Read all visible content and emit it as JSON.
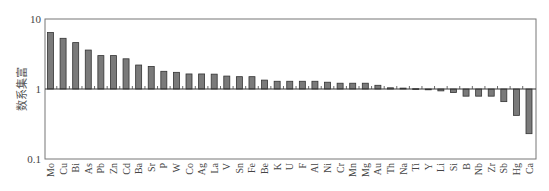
{
  "chart_data": {
    "type": "bar",
    "title": "",
    "xlabel": "",
    "ylabel": "富集系数",
    "yscale": "log",
    "ylim": [
      0.1,
      10
    ],
    "yticks": [
      {
        "value": 10,
        "label": "10"
      },
      {
        "value": 1,
        "label": "1"
      },
      {
        "value": 0.1,
        "label": "0.1"
      }
    ],
    "baseline": 1,
    "grid": false,
    "legend": null,
    "categories": [
      "Mo",
      "Cu",
      "Bi",
      "As",
      "Pb",
      "Zn",
      "Cd",
      "Ba",
      "Sr",
      "P",
      "W",
      "Co",
      "Ag",
      "La",
      "V",
      "Sn",
      "Fe",
      "Be",
      "K",
      "U",
      "F",
      "Al",
      "Ni",
      "Cr",
      "Mn",
      "Mg",
      "Au",
      "Th",
      "Na",
      "Ti",
      "Y",
      "Li",
      "Si",
      "B",
      "Nb",
      "Zr",
      "Sb",
      "Hg",
      "Ca"
    ],
    "values": [
      6.4,
      5.3,
      4.6,
      3.6,
      3.0,
      3.0,
      2.7,
      2.2,
      2.1,
      1.79,
      1.73,
      1.64,
      1.64,
      1.63,
      1.53,
      1.5,
      1.5,
      1.34,
      1.29,
      1.29,
      1.29,
      1.29,
      1.25,
      1.21,
      1.21,
      1.21,
      1.13,
      1.04,
      1.03,
      1.01,
      0.99,
      0.94,
      0.89,
      0.79,
      0.79,
      0.79,
      0.66,
      0.42,
      0.23
    ],
    "colors": {
      "bar_fill": "#7a7a7a",
      "bar_stroke": "#333333",
      "axis": "#555555"
    }
  }
}
